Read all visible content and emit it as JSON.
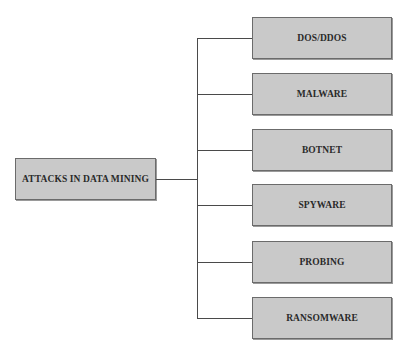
{
  "diagram": {
    "root": {
      "label": "ATTACKS IN DATA MINING"
    },
    "children": [
      {
        "label": "DOS/DDOS"
      },
      {
        "label": "MALWARE"
      },
      {
        "label": "BOTNET"
      },
      {
        "label": "SPYWARE"
      },
      {
        "label": "PROBING"
      },
      {
        "label": "RANSOMWARE"
      }
    ]
  },
  "colors": {
    "box_fill": "#c9c9c9",
    "box_border": "#6b6b6b",
    "connector": "#4a4a4a",
    "text": "#2a2a2a"
  }
}
